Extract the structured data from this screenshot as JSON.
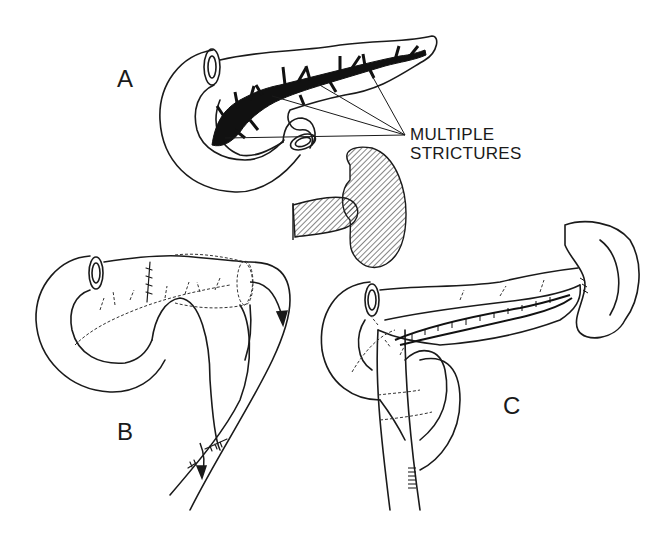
{
  "figure": {
    "type": "surgical illustration",
    "colors": {
      "ink": "#1a1a1a",
      "background": "#ffffff",
      "hatch": "#333333"
    }
  },
  "panels": [
    {
      "id": "A",
      "label": "A",
      "description": "Pancreas with duodenal C-loop; main duct dilated with multiple strictures (solid black)"
    },
    {
      "id": "B",
      "label": "B",
      "description": "Distal pancreas invaginated into Roux-en-Y jejunal limb; arrow shows drainage direction"
    },
    {
      "id": "C",
      "label": "C",
      "description": "Longitudinal pancreaticojejunostomy with Roux-en-Y limb; spleen at tail"
    }
  ],
  "inset": {
    "description": "Hatched spleen with pancreatic tail stump (resected)"
  },
  "callouts": [
    {
      "line1": "MULTIPLE",
      "line2": "STRICTURES",
      "points_to": "duct strictures in panel A"
    }
  ]
}
